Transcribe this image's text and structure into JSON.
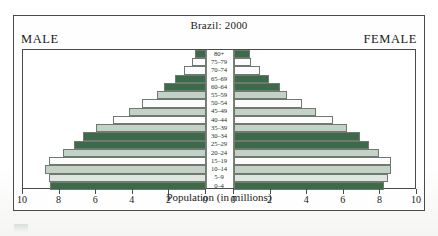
{
  "chart": {
    "title": "Brazil: 2000",
    "male_label": "MALE",
    "female_label": "FEMALE",
    "axis_title": "Population (in millions)"
  },
  "axis": {
    "male_ticks": [
      "10",
      "8",
      "6",
      "4",
      "2",
      "0"
    ],
    "female_ticks": [
      "0",
      "2",
      "4",
      "6",
      "8",
      "10"
    ],
    "max": 10,
    "step": 2
  },
  "colors": {
    "dark_green": "#3d6b4a",
    "sage": "#c3d1c6",
    "pale": "#dfe6e0",
    "white": "#fbfcfb",
    "outline": "#6e7a70",
    "frame": "#4a4a4a"
  },
  "chart_data": {
    "type": "bar",
    "subtype": "population-pyramid",
    "title": "Brazil: 2000",
    "xlabel": "Population (in millions)",
    "ylabel": "",
    "xlim": [
      -10,
      10
    ],
    "grid": false,
    "legend": "none",
    "categories": [
      "0-4",
      "5-9",
      "10-14",
      "15-19",
      "20-24",
      "25-29",
      "30-34",
      "35-39",
      "40-44",
      "45-49",
      "50-54",
      "55-59",
      "60-64",
      "65-69",
      "70-74",
      "75-79",
      "80+"
    ],
    "series": [
      {
        "name": "MALE",
        "side": "left",
        "values": [
          8.5,
          8.6,
          8.8,
          8.6,
          7.8,
          7.2,
          6.7,
          6.0,
          5.1,
          4.2,
          3.5,
          2.7,
          2.3,
          1.7,
          1.2,
          0.75,
          0.6
        ]
      },
      {
        "name": "FEMALE",
        "side": "right",
        "values": [
          8.2,
          8.4,
          8.6,
          8.6,
          7.9,
          7.4,
          6.9,
          6.2,
          5.4,
          4.5,
          3.7,
          2.9,
          2.5,
          1.9,
          1.4,
          0.95,
          0.9
        ]
      }
    ],
    "bar_fills": [
      "dark_green",
      "pale",
      "sage",
      "white",
      "sage",
      "dark_green",
      "dark_green",
      "sage",
      "white",
      "sage",
      "white",
      "sage",
      "dark_green",
      "dark_green",
      "white",
      "white",
      "dark_green"
    ]
  }
}
